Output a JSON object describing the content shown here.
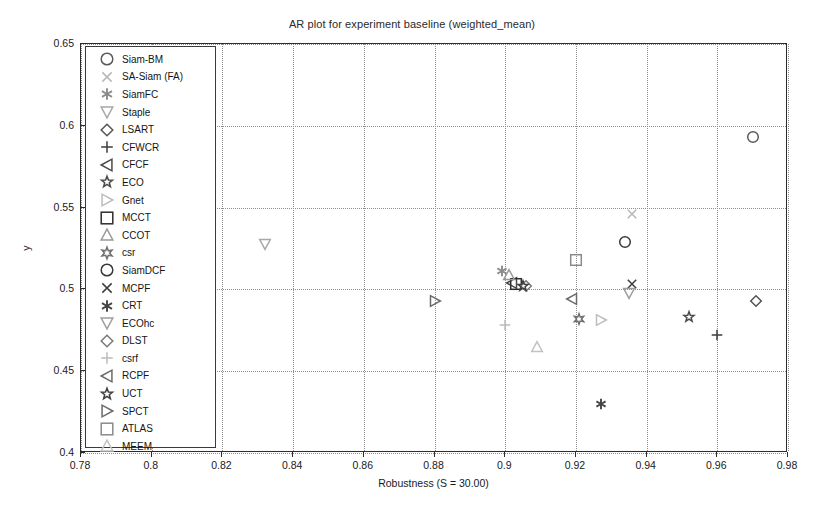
{
  "chart_data": {
    "type": "scatter",
    "title": "AR plot for experiment baseline (weighted_mean)",
    "xlabel": "Robustness (S = 30.00)",
    "ylabel": "y",
    "xlim": [
      0.78,
      0.98
    ],
    "ylim": [
      0.4,
      0.65
    ],
    "xticks": [
      0.78,
      0.8,
      0.82,
      0.84,
      0.86,
      0.88,
      0.9,
      0.92,
      0.94,
      0.96,
      0.98
    ],
    "xticklabels": [
      "0.78",
      "0.8",
      "0.82",
      "0.84",
      "0.86",
      "0.88",
      "0.9",
      "0.92",
      "0.94",
      "0.96",
      "0.98"
    ],
    "yticks": [
      0.4,
      0.45,
      0.5,
      0.55,
      0.6,
      0.65
    ],
    "yticklabels": [
      "0.4",
      "0.45",
      "0.5",
      "0.55",
      "0.6",
      "0.65"
    ],
    "grid": true,
    "grid_style": "dotted",
    "legend_position": "upper-left",
    "points": [
      {
        "label": "Siam-BM",
        "marker": "circle",
        "x": 0.97,
        "y": 0.593,
        "color": "#5a5a5a"
      },
      {
        "label": "SA-Siam (FA)",
        "marker": "cross-x",
        "x": 0.936,
        "y": 0.546,
        "color": "#b8b8b8"
      },
      {
        "label": "SiamFC",
        "marker": "asterisk6",
        "x": 0.899,
        "y": 0.511,
        "color": "#8c8c8c"
      },
      {
        "label": "Staple",
        "marker": "triangle-down",
        "x": 0.832,
        "y": 0.528,
        "color": "#a8a8a8"
      },
      {
        "label": "LSART",
        "marker": "diamond",
        "x": 0.971,
        "y": 0.493,
        "color": "#555555"
      },
      {
        "label": "CFWCR",
        "marker": "plus",
        "x": 0.96,
        "y": 0.472,
        "color": "#3d3d3d"
      },
      {
        "label": "CFCF",
        "marker": "triangle-left",
        "x": 0.902,
        "y": 0.504,
        "color": "#4a4a4a"
      },
      {
        "label": "ECO",
        "marker": "star5",
        "x": 0.952,
        "y": 0.483,
        "color": "#4a4a4a"
      },
      {
        "label": "Gnet",
        "marker": "triangle-right",
        "x": 0.927,
        "y": 0.481,
        "color": "#bdbdbd"
      },
      {
        "label": "MCCT",
        "marker": "square",
        "x": 0.903,
        "y": 0.503,
        "color": "#2e2e2e"
      },
      {
        "label": "CCOT",
        "marker": "triangle-up",
        "x": 0.901,
        "y": 0.509,
        "color": "#9a9a9a"
      },
      {
        "label": "csr",
        "marker": "star6",
        "x": 0.921,
        "y": 0.482,
        "color": "#6f6f6f"
      },
      {
        "label": "SiamDCF",
        "marker": "circle",
        "x": 0.934,
        "y": 0.529,
        "color": "#3a3a3a"
      },
      {
        "label": "MCPF",
        "marker": "cross-x",
        "x": 0.936,
        "y": 0.503,
        "color": "#3d3d3d"
      },
      {
        "label": "CRT",
        "marker": "asterisk6",
        "x": 0.927,
        "y": 0.43,
        "color": "#444444"
      },
      {
        "label": "ECOhc",
        "marker": "triangle-down",
        "x": 0.935,
        "y": 0.498,
        "color": "#9e9e9e"
      },
      {
        "label": "DLST",
        "marker": "diamond",
        "x": 0.906,
        "y": 0.502,
        "color": "#7a7a7a"
      },
      {
        "label": "csrf",
        "marker": "plus",
        "x": 0.9,
        "y": 0.478,
        "color": "#bcbcbc"
      },
      {
        "label": "RCPF",
        "marker": "triangle-left",
        "x": 0.919,
        "y": 0.494,
        "color": "#6a6a6a"
      },
      {
        "label": "UCT",
        "marker": "star5",
        "x": 0.905,
        "y": 0.502,
        "color": "#3f3f3f"
      },
      {
        "label": "SPCT",
        "marker": "triangle-right",
        "x": 0.88,
        "y": 0.493,
        "color": "#6a6a6a"
      },
      {
        "label": "ATLAS",
        "marker": "square",
        "x": 0.92,
        "y": 0.518,
        "color": "#8a8a8a"
      },
      {
        "label": "MEEM",
        "marker": "triangle-up",
        "x": 0.909,
        "y": 0.465,
        "color": "#c2c2c2"
      }
    ],
    "legend_entries": [
      {
        "label": "Siam-BM",
        "marker": "circle",
        "color": "#5a5a5a"
      },
      {
        "label": "SA-Siam (FA)",
        "marker": "cross-x",
        "color": "#b8b8b8"
      },
      {
        "label": "SiamFC",
        "marker": "asterisk6",
        "color": "#8c8c8c"
      },
      {
        "label": "Staple",
        "marker": "triangle-down",
        "color": "#a8a8a8"
      },
      {
        "label": "LSART",
        "marker": "diamond",
        "color": "#555555"
      },
      {
        "label": "CFWCR",
        "marker": "plus",
        "color": "#3d3d3d"
      },
      {
        "label": "CFCF",
        "marker": "triangle-left",
        "color": "#4a4a4a"
      },
      {
        "label": "ECO",
        "marker": "star5",
        "color": "#4a4a4a"
      },
      {
        "label": "Gnet",
        "marker": "triangle-right",
        "color": "#bdbdbd"
      },
      {
        "label": "MCCT",
        "marker": "square",
        "color": "#2e2e2e"
      },
      {
        "label": "CCOT",
        "marker": "triangle-up",
        "color": "#9a9a9a"
      },
      {
        "label": "csr",
        "marker": "star6",
        "color": "#6f6f6f"
      },
      {
        "label": "SiamDCF",
        "marker": "circle",
        "color": "#3a3a3a"
      },
      {
        "label": "MCPF",
        "marker": "cross-x",
        "color": "#3d3d3d"
      },
      {
        "label": "CRT",
        "marker": "asterisk6",
        "color": "#444444"
      },
      {
        "label": "ECOhc",
        "marker": "triangle-down",
        "color": "#9e9e9e"
      },
      {
        "label": "DLST",
        "marker": "diamond",
        "color": "#7a7a7a"
      },
      {
        "label": "csrf",
        "marker": "plus",
        "color": "#bcbcbc"
      },
      {
        "label": "RCPF",
        "marker": "triangle-left",
        "color": "#6a6a6a"
      },
      {
        "label": "UCT",
        "marker": "star5",
        "color": "#3f3f3f"
      },
      {
        "label": "SPCT",
        "marker": "triangle-right",
        "color": "#6a6a6a"
      },
      {
        "label": "ATLAS",
        "marker": "square",
        "color": "#8a8a8a"
      },
      {
        "label": "MEEM",
        "marker": "triangle-up",
        "color": "#c2c2c2"
      }
    ]
  }
}
